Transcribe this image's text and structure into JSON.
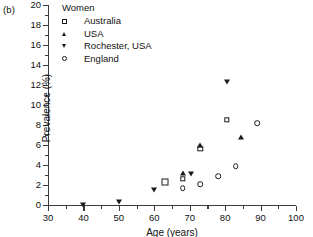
{
  "panel_label": "(b)",
  "legend": {
    "title": "Women",
    "entries": [
      {
        "label": "Australia",
        "marker": "open-square",
        "name": "legend-marker-australia"
      },
      {
        "label": "USA",
        "marker": "filled-triangle-up",
        "name": "legend-marker-usa"
      },
      {
        "label": "Rochester, USA",
        "marker": "filled-triangle-down",
        "name": "legend-marker-rochester"
      },
      {
        "label": "England",
        "marker": "open-circle",
        "name": "legend-marker-england"
      }
    ]
  },
  "axes": {
    "x_title": "Age (years)",
    "y_title": "Prevalence (%)",
    "x_ticks": [
      "30",
      "40",
      "50",
      "60",
      "70",
      "80",
      "90",
      "100"
    ],
    "y_ticks": [
      "0",
      "2",
      "4",
      "6",
      "8",
      "10",
      "12",
      "14",
      "16",
      "18",
      "20"
    ],
    "x_minor_ticks": [
      "35",
      "45",
      "55",
      "65",
      "75",
      "85",
      "95"
    ],
    "y_minor_ticks": [
      "1",
      "3",
      "5",
      "7",
      "9",
      "11",
      "13",
      "15",
      "17",
      "19"
    ]
  },
  "colors": {
    "marker": "#1a1a1a",
    "axis": "#3a3a3a",
    "text": "#111111",
    "background": "#ffffff"
  },
  "chart_data": {
    "type": "scatter",
    "title": "",
    "subtitle": "Women",
    "xlabel": "Age (years)",
    "ylabel": "Prevalence (%)",
    "xlim": [
      30,
      100
    ],
    "ylim": [
      0,
      20
    ],
    "xticks": [
      30,
      40,
      50,
      60,
      70,
      80,
      90,
      100
    ],
    "yticks": [
      0,
      2,
      4,
      6,
      8,
      10,
      12,
      14,
      16,
      18,
      20
    ],
    "grid": false,
    "legend_position": "top-left-inside",
    "series": [
      {
        "name": "Australia",
        "marker": "open-square",
        "points": [
          {
            "x": 63.0,
            "y": 2.3
          },
          {
            "x": 68.0,
            "y": 2.6
          },
          {
            "x": 73.0,
            "y": 5.6
          },
          {
            "x": 80.5,
            "y": 8.5
          }
        ]
      },
      {
        "name": "USA",
        "marker": "filled-triangle-up",
        "points": [
          {
            "x": 68.0,
            "y": 3.2
          },
          {
            "x": 73.0,
            "y": 6.0
          },
          {
            "x": 84.5,
            "y": 6.8
          }
        ]
      },
      {
        "name": "Rochester, USA",
        "marker": "filled-triangle-down",
        "points": [
          {
            "x": 40.0,
            "y": 0.0
          },
          {
            "x": 50.0,
            "y": 0.3
          },
          {
            "x": 60.0,
            "y": 1.5
          },
          {
            "x": 70.5,
            "y": 3.1
          },
          {
            "x": 80.5,
            "y": 12.3
          }
        ]
      },
      {
        "name": "England",
        "marker": "open-circle",
        "points": [
          {
            "x": 68.0,
            "y": 1.7
          },
          {
            "x": 73.0,
            "y": 2.1
          },
          {
            "x": 78.0,
            "y": 2.9
          },
          {
            "x": 83.0,
            "y": 3.9
          },
          {
            "x": 89.0,
            "y": 8.2
          }
        ]
      }
    ]
  }
}
